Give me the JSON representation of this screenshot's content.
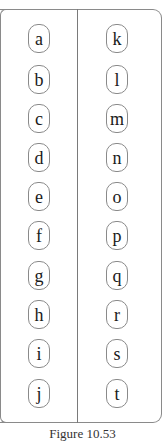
{
  "figure": {
    "left_column": [
      "a",
      "b",
      "c",
      "d",
      "e",
      "f",
      "g",
      "h",
      "i",
      "j"
    ],
    "right_column": [
      "k",
      "l",
      "m",
      "n",
      "o",
      "p",
      "q",
      "r",
      "s",
      "t"
    ],
    "caption": "Figure 10.53"
  },
  "colors": {
    "border": "#8a8a8a",
    "text": "#1a1a1a",
    "background": "#ffffff"
  }
}
